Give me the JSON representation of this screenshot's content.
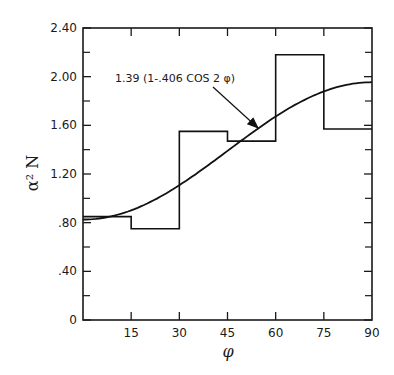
{
  "chart_data": {
    "type": "line",
    "title": "",
    "xlabel": "φ",
    "ylabel": "α² N",
    "xlim": [
      0,
      90
    ],
    "ylim": [
      0,
      2.4
    ],
    "grid": false,
    "x_ticks": [
      0,
      15,
      30,
      45,
      60,
      75,
      90
    ],
    "x_tick_labels": [
      "",
      "15",
      "30",
      "45",
      "60",
      "75",
      "90"
    ],
    "y_ticks": [
      0,
      0.4,
      0.8,
      1.2,
      1.6,
      2.0,
      2.4
    ],
    "y_tick_labels": [
      "0",
      ".40",
      ".80",
      "1.20",
      "1.60",
      "2.00",
      "2.40"
    ],
    "y_minor_ticks": [
      0.2,
      0.6,
      1.0,
      1.4,
      1.8,
      2.2
    ],
    "series": [
      {
        "name": "histogram",
        "style": "step",
        "bins": [
          {
            "x0": 0,
            "x1": 15,
            "y": 0.85
          },
          {
            "x0": 15,
            "x1": 30,
            "y": 0.75
          },
          {
            "x0": 30,
            "x1": 45,
            "y": 1.55
          },
          {
            "x0": 45,
            "x1": 60,
            "y": 1.47
          },
          {
            "x0": 60,
            "x1": 75,
            "y": 2.18
          },
          {
            "x0": 75,
            "x1": 90,
            "y": 1.57
          }
        ]
      },
      {
        "name": "fit",
        "style": "smooth",
        "formula": "1.39(1-.406 cos 2φ)",
        "A": 1.39,
        "B": 0.406,
        "x": [
          0,
          15,
          30,
          45,
          60,
          75,
          90
        ],
        "values": [
          0.826,
          0.901,
          1.108,
          1.39,
          1.672,
          1.879,
          1.954
        ]
      }
    ],
    "annotations": [
      {
        "text": "1.39 (1-.406 COS 2 φ)",
        "arrow_to": [
          48,
          1.56
        ]
      }
    ]
  }
}
